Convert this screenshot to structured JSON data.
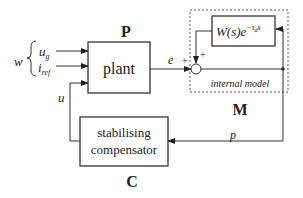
{
  "diagram": {
    "colors": {
      "stroke": "#333333",
      "text": "#222222",
      "background": "#ffffff"
    },
    "plant": {
      "title": "P",
      "label": "plant"
    },
    "inputs": {
      "w": "w",
      "u_g": "u",
      "u_g_sub": "g",
      "i_ref": "i",
      "i_ref_sub": "ref",
      "u": "u"
    },
    "error": {
      "label": "e",
      "sign": "+"
    },
    "internal_model": {
      "title": "M",
      "caption": "internal model",
      "block": "W(s)e",
      "block_exp": "−τ",
      "block_exp_sub": "d",
      "block_exp_s": "s",
      "feedback_sign": "+"
    },
    "compensator": {
      "title": "C",
      "line1": "stabilising",
      "line2": "compensator"
    },
    "signal_p": "p"
  }
}
